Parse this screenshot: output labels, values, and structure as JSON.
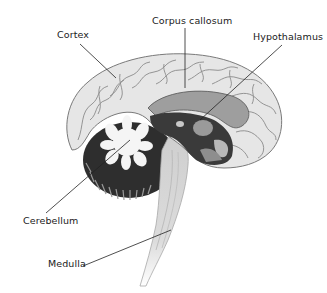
{
  "diagram": {
    "type": "anatomical-illustration",
    "labels": [
      {
        "id": "corpus-callosum",
        "text": "Corpus callosum",
        "x": 152,
        "y": 15,
        "line": [
          185,
          28,
          185,
          88
        ]
      },
      {
        "id": "cortex",
        "text": "Cortex",
        "x": 57,
        "y": 29,
        "line": [
          80,
          44,
          116,
          78
        ]
      },
      {
        "id": "hypothalamus",
        "text": "Hypothalamus",
        "x": 253,
        "y": 31,
        "line": [
          282,
          45,
          200,
          120
        ]
      },
      {
        "id": "cerebellum",
        "text": "Cerebellum",
        "x": 23,
        "y": 215,
        "line": [
          46,
          213,
          130,
          140
        ]
      },
      {
        "id": "medulla",
        "text": "Medulla",
        "x": 48,
        "y": 258,
        "line": [
          83,
          266,
          171,
          230
        ]
      }
    ],
    "colors": {
      "background": "#ffffff",
      "cortex_fill": "#e9e9e9",
      "cortex_stroke": "#6a6a6a",
      "inner_dark": "#3c3c3c",
      "cerebellum_dark": "#2a2a2a",
      "cerebellum_white": "#f4f4f4",
      "brainstem": "#d6d6d6",
      "label_text": "#1a1a1a",
      "leader_line": "#222222"
    }
  }
}
